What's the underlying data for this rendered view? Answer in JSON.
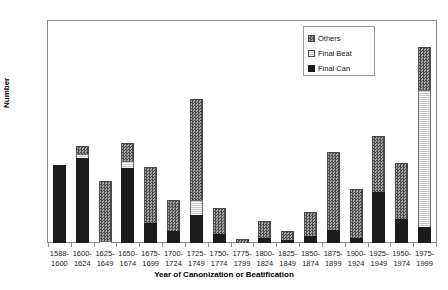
{
  "chart_data": {
    "type": "bar",
    "subtype": "stacked-vertical-bar",
    "title": "",
    "xlabel": "Year of Canonization or Beatification",
    "ylabel": "Number",
    "ylim": [
      0,
      250
    ],
    "yticks": [
      0,
      50,
      100,
      150,
      200,
      250
    ],
    "grid": false,
    "legend_position": "top-right",
    "categories": [
      "1588-\n1600",
      "1600-\n1624",
      "1625-\n1649",
      "1650-\n1674",
      "1675-\n1699",
      "1700-\n1724",
      "1725-\n1749",
      "1750-\n1774",
      "1775-\n1799",
      "1800-\n1824",
      "1825-\n1849",
      "1850-\n1874",
      "1875-\n1899",
      "1900-\n1924",
      "1925-\n1949",
      "1950-\n1974",
      "1975-\n1999"
    ],
    "series": [
      {
        "name": "Final Can",
        "color": "#1c1c1c",
        "pattern": "solid",
        "values": [
          88,
          96,
          0,
          85,
          22,
          14,
          32,
          10,
          0,
          6,
          3,
          8,
          15,
          6,
          57,
          27,
          18
        ]
      },
      {
        "name": "Final Beat",
        "color": "#c9c9c9",
        "pattern": "light-hatch",
        "values": [
          0,
          4,
          2,
          7,
          0,
          0,
          16,
          0,
          0,
          0,
          0,
          0,
          0,
          0,
          0,
          0,
          154
        ]
      },
      {
        "name": "Others",
        "color": "#6e6e6e",
        "pattern": "checker",
        "values": [
          0,
          9,
          68,
          21,
          64,
          34,
          114,
          30,
          5,
          19,
          11,
          27,
          87,
          55,
          64,
          63,
          49
        ]
      }
    ],
    "totals": [
      88,
      109,
      70,
      113,
      86,
      48,
      162,
      40,
      5,
      25,
      14,
      35,
      102,
      61,
      121,
      90,
      221
    ]
  },
  "legend": {
    "items": [
      {
        "label": "Others",
        "key": "others"
      },
      {
        "label": "Final Beat",
        "key": "beat"
      },
      {
        "label": "Final Can",
        "key": "can"
      }
    ]
  }
}
